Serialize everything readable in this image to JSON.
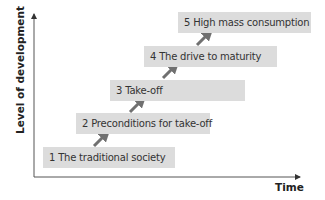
{
  "diagram": {
    "type": "staircase",
    "axes": {
      "y_label": "Level of development",
      "x_label": "Time"
    },
    "stages": [
      {
        "label": "1 The traditional society"
      },
      {
        "label": "2 Preconditions for take-off"
      },
      {
        "label": "3 Take-off"
      },
      {
        "label": "4 The drive to maturity"
      },
      {
        "label": "5 High mass consumption"
      }
    ],
    "colors": {
      "box_fill": "#dcdcdc",
      "arrow": "#707070",
      "axis": "#555555",
      "text": "#333333"
    }
  }
}
